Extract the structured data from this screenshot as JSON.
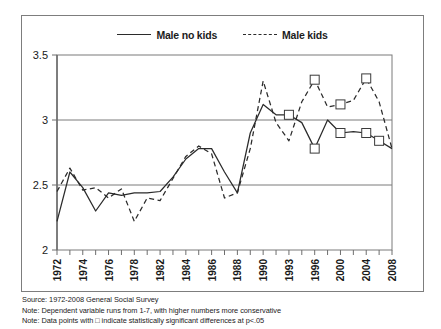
{
  "figure": {
    "legend_items": [
      {
        "label": "Male no kids",
        "style": "solid",
        "color": "#2b2b2b"
      },
      {
        "label": "Male kids",
        "style": "dashed",
        "color": "#2b2b2b"
      }
    ],
    "footer_lines": [
      "Source: 1972-2008 General Social Survey",
      "Note: Dependent variable runs from 1-7, with higher numbers more conservative",
      "Note: Data points with □ indicate statistically significant differences at p<.05"
    ]
  },
  "chart_data": {
    "type": "line",
    "title": "",
    "xlabel": "",
    "ylabel": "",
    "ylim": [
      2,
      3.5
    ],
    "yticks": [
      2,
      2.5,
      3,
      3.5
    ],
    "ytick_labels": [
      "2",
      "2.5",
      "3",
      "3.5"
    ],
    "grid": true,
    "legend_position": "top-center",
    "x": [
      1972,
      1973,
      1974,
      1975,
      1976,
      1977,
      1978,
      1980,
      1982,
      1983,
      1984,
      1985,
      1986,
      1987,
      1988,
      1989,
      1990,
      1991,
      1993,
      1994,
      1996,
      1998,
      2000,
      2002,
      2004,
      2006,
      2008
    ],
    "xtick_labels": [
      "1972",
      "",
      "1974",
      "",
      "1976",
      "",
      "1978",
      "",
      "1982",
      "",
      "1984",
      "",
      "1986",
      "",
      "1988",
      "",
      "1990",
      "",
      "1993",
      "",
      "1996",
      "",
      "2000",
      "",
      "2004",
      "",
      "2008"
    ],
    "series": [
      {
        "name": "Male no kids",
        "style": "solid",
        "color": "#2b2b2b",
        "values": [
          2.22,
          2.6,
          2.48,
          2.3,
          2.44,
          2.42,
          2.44,
          2.44,
          2.45,
          2.56,
          2.7,
          2.78,
          2.78,
          2.6,
          2.44,
          2.9,
          3.12,
          3.04,
          3.04,
          2.98,
          2.78,
          3.0,
          2.9,
          2.91,
          2.9,
          2.84,
          2.78
        ],
        "significant_markers": [
          1993,
          1996,
          2000,
          2004,
          2006
        ]
      },
      {
        "name": "Male kids",
        "style": "dashed",
        "color": "#2b2b2b",
        "values": [
          2.45,
          2.63,
          2.46,
          2.48,
          2.4,
          2.47,
          2.22,
          2.4,
          2.38,
          2.55,
          2.72,
          2.8,
          2.74,
          2.4,
          2.44,
          2.78,
          3.3,
          2.98,
          2.84,
          3.14,
          3.31,
          3.1,
          3.12,
          3.15,
          3.32,
          3.14,
          2.78
        ],
        "significant_markers": [
          1996,
          2000,
          2004
        ]
      }
    ]
  }
}
